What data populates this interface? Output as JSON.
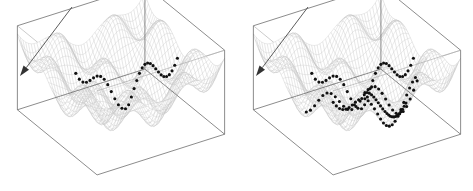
{
  "figure": {
    "title": "",
    "caption": "",
    "background_color": "#ffffff",
    "panel_count": 2
  },
  "chart_data": {
    "type": "line",
    "title": "",
    "subtitle": "",
    "xlabel": "",
    "ylabel": "",
    "zlabel": "",
    "grid": true,
    "legend_position": "none",
    "render": "3d-surface-wireframe-with-trajectories",
    "surface": {
      "formula": "z = a*(x^2 + y^2) - b*cos(k*x)*cos(k*y)",
      "a": 0.055,
      "b": 0.42,
      "k": 2.35,
      "x_range": [
        -3.2,
        3.2
      ],
      "y_range": [
        -3.2,
        3.2
      ],
      "z_range": [
        -0.5,
        1.25
      ],
      "mesh_rows": 46,
      "mesh_cols": 46,
      "mesh_color": "#b9b9b9",
      "face_color": "#ffffff"
    },
    "projection": {
      "type": "axonometric",
      "azimuth_deg": -58,
      "elevation_deg": 26,
      "scale_x": 23.5,
      "scale_y": 12.0,
      "scale_z": 48.0
    },
    "box": {
      "stroke": "#5a5a5a",
      "stroke_faint": "#a8a8a8",
      "line_width": 0.7,
      "visible": true
    },
    "panels": [
      {
        "id": "panel-left",
        "name": "single-trajectory-panel",
        "origin_x": 0,
        "trajectory_count": 1,
        "dot_color": "#111111",
        "dot_radius": 1.55,
        "trajectories": [
          {
            "name": "descent-path-1",
            "n_points": 34,
            "start": [
              -0.35,
              3.05
            ],
            "end": [
              -1.95,
              -1.05
            ],
            "bend_at": 0.56,
            "mid": [
              -0.05,
              0.35
            ]
          }
        ]
      },
      {
        "id": "panel-right",
        "name": "multi-trajectory-panel",
        "origin_x": 236,
        "trajectory_count": 4,
        "dot_color": "#111111",
        "dot_radius": 1.55,
        "trajectories": [
          {
            "name": "descent-path-1",
            "n_points": 34,
            "start": [
              -0.35,
              3.05
            ],
            "end": [
              -1.95,
              -1.05
            ],
            "bend_at": 0.56,
            "mid": [
              -0.05,
              0.35
            ]
          },
          {
            "name": "descent-path-2",
            "n_points": 30,
            "start": [
              1.55,
              2.05
            ],
            "end": [
              -0.15,
              -2.45
            ],
            "bend_at": 0.5,
            "mid": [
              1.15,
              -0.25
            ]
          },
          {
            "name": "descent-path-3",
            "n_points": 28,
            "start": [
              2.85,
              1.15
            ],
            "end": [
              1.85,
              -2.35
            ],
            "bend_at": 0.48,
            "mid": [
              2.55,
              -0.55
            ]
          },
          {
            "name": "descent-path-4",
            "n_points": 22,
            "start": [
              3.05,
              0.55
            ],
            "end": [
              2.95,
              -1.45
            ],
            "bend_at": 0.55,
            "mid": [
              3.05,
              -0.45
            ]
          }
        ]
      }
    ],
    "arrow": {
      "name": "direction-arrow",
      "label": "",
      "color": "#4a4a4a",
      "head_color": "#333333",
      "panel_left": {
        "x1": 72,
        "y1": 7,
        "x2": 20,
        "y2": 76
      },
      "panel_right": {
        "x1": 308,
        "y1": 7,
        "x2": 256,
        "y2": 76
      },
      "head_size": 5.5
    }
  }
}
